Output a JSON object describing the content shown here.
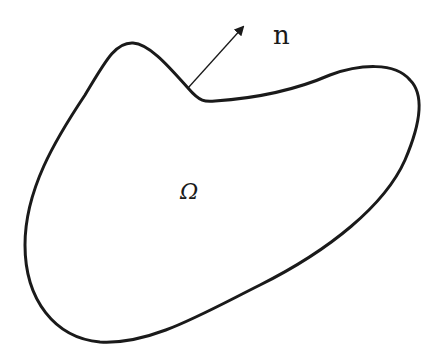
{
  "diagram": {
    "type": "domain-with-normal-vector",
    "region_label": "Ω",
    "normal_label": "n",
    "colors": {
      "background": "#ffffff",
      "stroke": "#1a1a1a"
    },
    "boundary": {
      "description": "Closed smooth curve bounding domain Ω with a concave dip near the top",
      "stroke_width": 3
    },
    "normal_vector": {
      "from": [
        188,
        88
      ],
      "to": [
        245,
        25
      ],
      "description": "Outward unit normal arrow at boundary"
    }
  }
}
